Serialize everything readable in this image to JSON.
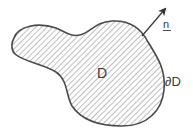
{
  "diagram": {
    "type": "domain-with-boundary",
    "labels": {
      "domain": "D",
      "boundary": "∂D",
      "normal": "n"
    },
    "elements": [
      {
        "name": "domain-region",
        "description": "Hatched irregular region (kidney/peanut shape)",
        "label": "D"
      },
      {
        "name": "boundary-curve",
        "description": "Closed boundary of the region",
        "label": "∂D"
      },
      {
        "name": "normal-vector",
        "description": "Outward unit normal arrow on upper right boundary",
        "label": "n",
        "underlined": true
      }
    ],
    "colors": {
      "stroke": "#4a4a4a",
      "hatch": "#8a8a8a",
      "background": "#ffffff",
      "text": "#3a3a3a"
    }
  }
}
